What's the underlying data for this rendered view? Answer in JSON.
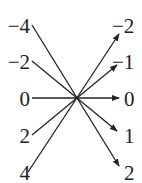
{
  "diagram": {
    "type": "mapping",
    "left_values": [
      "−4",
      "−2",
      "0",
      "2",
      "4"
    ],
    "right_values": [
      "−2",
      "−1",
      "0",
      "1",
      "2"
    ],
    "mappings": [
      {
        "from": "−4",
        "to": "2"
      },
      {
        "from": "−2",
        "to": "1"
      },
      {
        "from": "0",
        "to": "0"
      },
      {
        "from": "2",
        "to": "−1"
      },
      {
        "from": "4",
        "to": "−2"
      }
    ],
    "line_color": "#222222"
  }
}
